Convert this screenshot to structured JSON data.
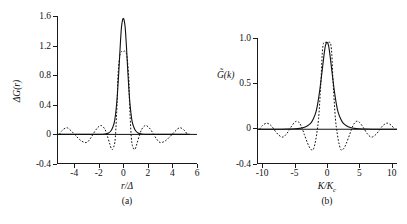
{
  "figure": {
    "panels": [
      {
        "id": "a",
        "caption": "(a)",
        "ylabel": "ΔG(r)",
        "xlabel_num": "r",
        "xlabel_den": "Δ",
        "chart_data": {
          "type": "line",
          "title": "",
          "xlabel": "r/Δ",
          "ylabel": "ΔG(r)",
          "xlim": [
            -5.4,
            6.0
          ],
          "ylim": [
            -0.4,
            1.6
          ],
          "xticks": [
            -4,
            -2,
            0,
            2,
            4,
            6
          ],
          "xtick_labels": [
            "-4",
            "-2",
            "0",
            "2",
            "4",
            "6"
          ],
          "yticks": [
            -0.4,
            0,
            0.4,
            0.8,
            1.2,
            1.6
          ],
          "ytick_labels": [
            "-0.4",
            "0",
            "0.4",
            "0.8",
            "1.2",
            "1.6"
          ],
          "grid": false,
          "legend": "none",
          "series": [
            {
              "name": "gaussian-kernel",
              "style": "solid",
              "peak_value": 1.56,
              "peak_x": 0.0,
              "description": "smooth narrow peak decaying to zero",
              "x": [
                -5.4,
                -4.6,
                -3.8,
                -3.0,
                -2.4,
                -1.9,
                -1.5,
                -1.2,
                -1.0,
                -0.85,
                -0.7,
                -0.55,
                -0.45,
                -0.35,
                -0.25,
                -0.15,
                -0.05,
                0,
                0.05,
                0.15,
                0.25,
                0.35,
                0.45,
                0.55,
                0.7,
                0.85,
                1.0,
                1.2,
                1.5,
                1.9,
                2.4,
                3.0,
                3.8,
                4.6,
                5.4
              ],
              "y": [
                0,
                0,
                0,
                0,
                0,
                0,
                0.005,
                0.02,
                0.05,
                0.1,
                0.19,
                0.4,
                0.62,
                0.9,
                1.2,
                1.45,
                1.555,
                1.56,
                1.555,
                1.45,
                1.2,
                0.9,
                0.62,
                0.4,
                0.19,
                0.1,
                0.05,
                0.02,
                0.005,
                0,
                0,
                0,
                0,
                0,
                0
              ]
            },
            {
              "name": "sinc-sharp-cutoff",
              "style": "dotted",
              "peak_value": 1.12,
              "peak_x": 0.0,
              "description": "box-like top with sinc side lobes",
              "x": [
                -5.2,
                -5.0,
                -4.6,
                -4.2,
                -3.8,
                -3.4,
                -3.0,
                -2.7,
                -2.4,
                -2.1,
                -1.8,
                -1.5,
                -1.3,
                -1.1,
                -0.95,
                -0.8,
                -0.65,
                -0.5,
                -0.45,
                -0.3,
                -0.15,
                0,
                0.15,
                0.3,
                0.45,
                0.5,
                0.65,
                0.8,
                0.95,
                1.1,
                1.3,
                1.5,
                1.8,
                2.1,
                2.4,
                2.7,
                3.0,
                3.4,
                3.8,
                4.2,
                4.6,
                5.0,
                5.2
              ],
              "y": [
                0.0,
                0.05,
                0.09,
                0.04,
                -0.03,
                -0.09,
                -0.11,
                -0.06,
                0.02,
                0.09,
                0.12,
                0.07,
                -0.02,
                -0.13,
                -0.2,
                -0.18,
                -0.04,
                0.45,
                0.75,
                1.05,
                1.12,
                1.12,
                1.12,
                1.05,
                0.75,
                0.45,
                -0.04,
                -0.18,
                -0.2,
                -0.13,
                -0.02,
                0.07,
                0.12,
                0.09,
                0.02,
                -0.06,
                -0.11,
                -0.09,
                -0.03,
                0.04,
                0.09,
                0.05,
                0.0
              ]
            }
          ]
        }
      },
      {
        "id": "b",
        "caption": "(b)",
        "ylabel": "G̃(k)",
        "xlabel_num": "K",
        "xlabel_den": "K",
        "xlabel_den_sub": "c",
        "chart_data": {
          "type": "line",
          "title": "",
          "xlabel": "K/Kc",
          "ylabel": "G̃(k)",
          "xlim": [
            -10.8,
            10.8
          ],
          "ylim": [
            -0.4,
            1.05
          ],
          "xticks": [
            -10,
            -5,
            0,
            5,
            10
          ],
          "xtick_labels": [
            "-10",
            "-5",
            "0",
            "5",
            "10"
          ],
          "yticks": [
            -0.4,
            0,
            0.5,
            1.0
          ],
          "ytick_labels": [
            "-0.4",
            "0",
            "0.5",
            "1.0"
          ],
          "grid": false,
          "legend": "none",
          "series": [
            {
              "name": "gaussian-transform",
              "style": "solid",
              "peak_value": 1.0,
              "peak_x": 0.0,
              "description": "smooth bell decaying to zero",
              "x": [
                -10.8,
                -9,
                -7.5,
                -6,
                -5,
                -4.2,
                -3.6,
                -3.0,
                -2.5,
                -2.1,
                -1.7,
                -1.4,
                -1.1,
                -0.8,
                -0.5,
                -0.25,
                0,
                0.25,
                0.5,
                0.8,
                1.1,
                1.4,
                1.7,
                2.1,
                2.5,
                3.0,
                3.6,
                4.2,
                5,
                6,
                7.5,
                9,
                10.8
              ],
              "y": [
                0,
                0,
                0,
                0.002,
                0.005,
                0.01,
                0.02,
                0.04,
                0.07,
                0.12,
                0.2,
                0.31,
                0.46,
                0.64,
                0.83,
                0.96,
                1.0,
                0.96,
                0.83,
                0.64,
                0.46,
                0.31,
                0.2,
                0.12,
                0.07,
                0.04,
                0.02,
                0.01,
                0.005,
                0.002,
                0,
                0,
                0
              ]
            },
            {
              "name": "sinc-transform",
              "style": "dotted",
              "peak_value": 1.0,
              "peak_x": 0.0,
              "description": "near-box top with oscillating side lobes",
              "x": [
                -10.4,
                -10,
                -9.3,
                -8.6,
                -8,
                -7.4,
                -6.8,
                -6.2,
                -5.6,
                -5.0,
                -4.5,
                -4.0,
                -3.5,
                -3.0,
                -2.6,
                -2.2,
                -1.9,
                -1.6,
                -1.3,
                -1.05,
                -0.9,
                -0.75,
                -0.6,
                -0.45,
                -0.25,
                0,
                0.25,
                0.45,
                0.6,
                0.75,
                0.9,
                1.05,
                1.3,
                1.6,
                1.9,
                2.2,
                2.6,
                3.0,
                3.5,
                4.0,
                4.5,
                5.0,
                5.6,
                6.2,
                6.8,
                7.4,
                8,
                8.6,
                9.3,
                10,
                10.4
              ],
              "y": [
                0.0,
                0.04,
                0.07,
                0.04,
                -0.02,
                -0.07,
                -0.09,
                -0.05,
                0.02,
                0.08,
                0.09,
                0.04,
                -0.06,
                -0.16,
                -0.22,
                -0.24,
                -0.18,
                -0.06,
                0.12,
                0.4,
                0.6,
                0.85,
                0.97,
                1.0,
                1.0,
                1.0,
                1.0,
                1.0,
                0.97,
                0.85,
                0.6,
                0.4,
                0.12,
                -0.06,
                -0.18,
                -0.24,
                -0.22,
                -0.16,
                -0.06,
                0.04,
                0.09,
                0.08,
                0.02,
                -0.05,
                -0.09,
                -0.07,
                -0.02,
                0.04,
                0.07,
                0.04,
                0.0
              ]
            }
          ]
        }
      }
    ]
  }
}
